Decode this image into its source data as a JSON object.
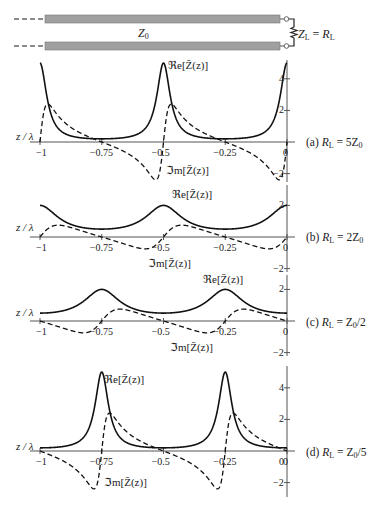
{
  "circuit": {
    "line_label": "Z",
    "line_label_sub": "0",
    "load_label": "Z",
    "load_label_sub": "L",
    "load_eq": " = ",
    "load_value": "R",
    "load_value_sub": "L"
  },
  "axis": {
    "xlabel": "z / λ",
    "x_ticks": [
      "-1",
      "-0.75",
      "-0.5",
      "-0.25",
      "0"
    ],
    "x_tick_values": [
      -1,
      -0.75,
      -0.5,
      -0.25,
      0
    ]
  },
  "curve_labels": {
    "re": "ℜe[Z̄(z)]",
    "im": "ℑm[Z̄(z)]"
  },
  "colors": {
    "curve": "#111111",
    "axis": "#555555",
    "line_fill": "#9a9a9a"
  },
  "chart_data": [
    {
      "type": "line",
      "panel": "(a)",
      "title": "(a) R_L = 5Z_0",
      "caption_prefix": "(a) ",
      "caption_R": "R",
      "caption_sub": "L",
      "caption_rest": " = 5Z",
      "caption_sub2": "0",
      "r": 5,
      "xlabel": "z/λ",
      "xlim": [
        -1,
        0
      ],
      "y_ticks": [
        "4",
        "2",
        "-2"
      ],
      "y_tick_values": [
        4,
        2,
        -2
      ],
      "ylim": [
        -2.6,
        5.2
      ],
      "series": [
        {
          "name": "ℜe[Z̄(z)]",
          "style": "solid",
          "x": [
            -1,
            -0.9,
            -0.75,
            -0.6,
            -0.5,
            -0.4,
            -0.25,
            -0.1,
            0
          ],
          "values": [
            5,
            0.57,
            0.2,
            0.57,
            5,
            0.57,
            0.2,
            0.57,
            5
          ]
        },
        {
          "name": "ℑm[Z̄(z)]",
          "style": "dashed",
          "x": [
            -1,
            -0.95,
            -0.75,
            -0.52,
            -0.5,
            -0.45,
            -0.25,
            -0.02,
            0
          ],
          "values": [
            0,
            2.4,
            0,
            -2.4,
            0,
            2.4,
            0,
            -2.4,
            0
          ]
        }
      ]
    },
    {
      "type": "line",
      "panel": "(b)",
      "title": "(b) R_L = 2Z_0",
      "caption_prefix": "(b) ",
      "caption_R": "R",
      "caption_sub": "L",
      "caption_rest": " = 2Z",
      "caption_sub2": "0",
      "r": 2,
      "xlabel": "z/λ",
      "xlim": [
        -1,
        0
      ],
      "y_ticks": [
        "2",
        "-2"
      ],
      "y_tick_values": [
        2,
        -2
      ],
      "ylim": [
        -2.4,
        2.5
      ],
      "series": [
        {
          "name": "ℜe[Z̄(z)]",
          "style": "solid",
          "x": [
            -1,
            -0.75,
            -0.5,
            -0.25,
            0
          ],
          "values": [
            2,
            0.5,
            2,
            0.5,
            2
          ]
        },
        {
          "name": "ℑm[Z̄(z)]",
          "style": "dashed",
          "x": [
            -1,
            -0.9,
            -0.75,
            -0.6,
            -0.5,
            -0.4,
            -0.25,
            -0.1,
            0
          ],
          "values": [
            0,
            0.75,
            0,
            -0.75,
            0,
            0.75,
            0,
            -0.75,
            0
          ]
        }
      ]
    },
    {
      "type": "line",
      "panel": "(c)",
      "title": "(c) R_L = Z_0/2",
      "caption_prefix": "(c) ",
      "caption_R": "R",
      "caption_sub": "L",
      "caption_rest": " = Z",
      "caption_sub2": "0",
      "caption_tail": "/2",
      "r": 0.5,
      "xlabel": "z/λ",
      "xlim": [
        -1,
        0
      ],
      "y_ticks": [
        "2",
        "-2"
      ],
      "y_tick_values": [
        2,
        -2
      ],
      "ylim": [
        -2.4,
        2.5
      ],
      "series": [
        {
          "name": "ℜe[Z̄(z)]",
          "style": "solid",
          "x": [
            -1,
            -0.75,
            -0.5,
            -0.25,
            0
          ],
          "values": [
            0.5,
            2,
            0.5,
            2,
            0.5
          ]
        },
        {
          "name": "ℑm[Z̄(z)]",
          "style": "dashed",
          "x": [
            -1,
            -0.9,
            -0.75,
            -0.6,
            -0.5,
            -0.4,
            -0.25,
            -0.1,
            0
          ],
          "values": [
            0,
            -0.75,
            0,
            0.75,
            0,
            -0.75,
            0,
            0.75,
            0
          ]
        }
      ]
    },
    {
      "type": "line",
      "panel": "(d)",
      "title": "(d) R_L = Z_0/5",
      "caption_prefix": "(d) ",
      "caption_R": "R",
      "caption_sub": "L",
      "caption_rest": " = Z",
      "caption_sub2": "0",
      "caption_tail": "/5",
      "r": 0.2,
      "xlabel": "z/λ",
      "xlim": [
        -1,
        0
      ],
      "y_ticks": [
        "4",
        "2",
        "0",
        "-2"
      ],
      "y_tick_values": [
        4,
        2,
        0,
        -2
      ],
      "ylim": [
        -2.9,
        5.4
      ],
      "series": [
        {
          "name": "ℜe[Z̄(z)]",
          "style": "solid",
          "x": [
            -1,
            -0.85,
            -0.75,
            -0.65,
            -0.5,
            -0.35,
            -0.25,
            -0.15,
            0
          ],
          "values": [
            0.2,
            0.57,
            5,
            0.57,
            0.2,
            0.57,
            5,
            0.57,
            0.2
          ]
        },
        {
          "name": "ℑm[Z̄(z)]",
          "style": "dashed",
          "x": [
            -1,
            -0.77,
            -0.75,
            -0.7,
            -0.5,
            -0.27,
            -0.25,
            -0.2,
            0
          ],
          "values": [
            0,
            -2.4,
            0,
            2.4,
            0,
            -2.4,
            0,
            2.4,
            0
          ]
        }
      ]
    }
  ]
}
